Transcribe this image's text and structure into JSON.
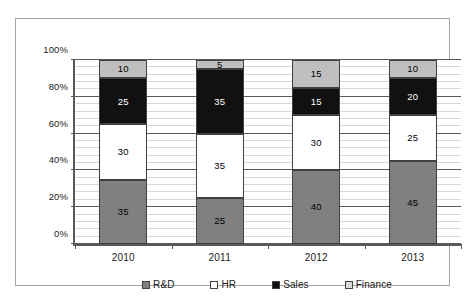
{
  "chart_data": {
    "type": "bar",
    "subtype": "stacked-100-percent-column",
    "title": "",
    "xlabel": "",
    "ylabel": "",
    "categories": [
      "2010",
      "2011",
      "2012",
      "2013"
    ],
    "series": [
      {
        "name": "R&D",
        "color": "#808080",
        "values": [
          35,
          25,
          40,
          45
        ]
      },
      {
        "name": "HR",
        "color": "#ffffff",
        "values": [
          30,
          35,
          30,
          25
        ]
      },
      {
        "name": "Sales",
        "color": "#111111",
        "values": [
          25,
          35,
          15,
          20
        ]
      },
      {
        "name": "Finance",
        "color": "#bfbfbf",
        "values": [
          10,
          5,
          15,
          10
        ]
      }
    ],
    "ylim": [
      0,
      100
    ],
    "y_ticks": [
      "0%",
      "20%",
      "40%",
      "60%",
      "80%",
      "100%"
    ],
    "y_tick_values": [
      0,
      20,
      40,
      60,
      80,
      100
    ],
    "minor_gridline_step": 4,
    "grid": true,
    "legend_position": "bottom",
    "data_labels": true
  },
  "axis": {
    "y_ticks": [
      {
        "label": "100%",
        "value": 100
      },
      {
        "label": "80%",
        "value": 80
      },
      {
        "label": "60%",
        "value": 60
      },
      {
        "label": "40%",
        "value": 40
      },
      {
        "label": "20%",
        "value": 20
      },
      {
        "label": "0%",
        "value": 0
      }
    ],
    "x_ticks": [
      {
        "label": "2010"
      },
      {
        "label": "2011"
      },
      {
        "label": "2012"
      },
      {
        "label": "2013"
      }
    ]
  },
  "legend": {
    "items": [
      {
        "label": "R&D",
        "swatch": "rd"
      },
      {
        "label": "HR",
        "swatch": "hr"
      },
      {
        "label": "Sales",
        "swatch": "sales"
      },
      {
        "label": "Finance",
        "swatch": "fin"
      }
    ]
  },
  "bars": [
    {
      "category": "2010",
      "segments": [
        {
          "series": "R&D",
          "value": 35,
          "label": "35",
          "cls": "rd"
        },
        {
          "series": "HR",
          "value": 30,
          "label": "30",
          "cls": "hr"
        },
        {
          "series": "Sales",
          "value": 25,
          "label": "25",
          "cls": "sales"
        },
        {
          "series": "Finance",
          "value": 10,
          "label": "10",
          "cls": "fin"
        }
      ]
    },
    {
      "category": "2011",
      "segments": [
        {
          "series": "R&D",
          "value": 25,
          "label": "25",
          "cls": "rd"
        },
        {
          "series": "HR",
          "value": 35,
          "label": "35",
          "cls": "hr"
        },
        {
          "series": "Sales",
          "value": 35,
          "label": "35",
          "cls": "sales"
        },
        {
          "series": "Finance",
          "value": 5,
          "label": "5",
          "cls": "fin"
        }
      ]
    },
    {
      "category": "2012",
      "segments": [
        {
          "series": "R&D",
          "value": 40,
          "label": "40",
          "cls": "rd"
        },
        {
          "series": "HR",
          "value": 30,
          "label": "30",
          "cls": "hr"
        },
        {
          "series": "Sales",
          "value": 15,
          "label": "15",
          "cls": "sales"
        },
        {
          "series": "Finance",
          "value": 15,
          "label": "15",
          "cls": "fin"
        }
      ]
    },
    {
      "category": "2013",
      "segments": [
        {
          "series": "R&D",
          "value": 45,
          "label": "45",
          "cls": "rd"
        },
        {
          "series": "HR",
          "value": 25,
          "label": "25",
          "cls": "hr"
        },
        {
          "series": "Sales",
          "value": 20,
          "label": "20",
          "cls": "sales"
        },
        {
          "series": "Finance",
          "value": 10,
          "label": "10",
          "cls": "fin"
        }
      ]
    }
  ]
}
